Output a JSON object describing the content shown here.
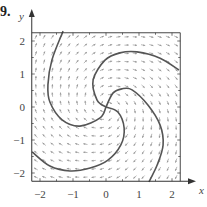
{
  "problem_number": "9.",
  "chart_data": {
    "type": "direction_field_with_solution_curves",
    "title": "",
    "xlabel": "x",
    "ylabel": "y",
    "xlim": [
      -2.25,
      2.25
    ],
    "ylim": [
      -2.25,
      2.25
    ],
    "xticks": [
      -2,
      -1,
      0,
      1,
      2
    ],
    "yticks": [
      -2,
      -1,
      0,
      1,
      2
    ],
    "xtick_labels": [
      "−2",
      "−1",
      "0",
      "1",
      "2"
    ],
    "ytick_labels": [
      "−2",
      "−1",
      "0",
      "1",
      "2"
    ],
    "minor_tick_step": 0.5,
    "grid": false,
    "direction_field": {
      "spacing": 0.25,
      "arrow_color": "#9a9a9a",
      "arrow_length": 0.13,
      "description": "clockwise swirl around origin with outward spiral component"
    },
    "solution_curves": [
      {
        "name": "arm-1",
        "points": [
          [
            0,
            0
          ],
          [
            -0.27,
            0.21
          ],
          [
            -0.39,
            0.82
          ],
          [
            -0.03,
            1.42
          ],
          [
            0.42,
            1.64
          ],
          [
            0.94,
            1.67
          ],
          [
            1.64,
            1.48
          ],
          [
            2.21,
            1.12
          ]
        ]
      },
      {
        "name": "arm-2",
        "points": [
          [
            0,
            0
          ],
          [
            0.36,
            -0.15
          ],
          [
            0.55,
            -0.64
          ],
          [
            0.45,
            -1.15
          ],
          [
            0.06,
            -1.61
          ],
          [
            -0.48,
            -1.85
          ],
          [
            -1.09,
            -1.94
          ],
          [
            -1.7,
            -1.79
          ],
          [
            -2.24,
            -1.36
          ]
        ]
      },
      {
        "name": "arm-3",
        "points": [
          [
            0,
            0
          ],
          [
            -0.18,
            -0.33
          ],
          [
            -0.79,
            -0.58
          ],
          [
            -1.33,
            -0.39
          ],
          [
            -1.7,
            0.15
          ],
          [
            -1.76,
            0.67
          ],
          [
            -1.64,
            1.42
          ],
          [
            -1.3,
            2.3
          ]
        ]
      },
      {
        "name": "arm-4",
        "points": [
          [
            0,
            0
          ],
          [
            0.21,
            0.42
          ],
          [
            0.48,
            0.55
          ],
          [
            0.79,
            0.52
          ],
          [
            1.27,
            0.06
          ],
          [
            1.64,
            -0.55
          ],
          [
            1.73,
            -1.15
          ],
          [
            1.55,
            -1.76
          ],
          [
            1.3,
            -2.27
          ]
        ]
      }
    ],
    "curve_color": "#555555",
    "axis_color": "#333333"
  }
}
